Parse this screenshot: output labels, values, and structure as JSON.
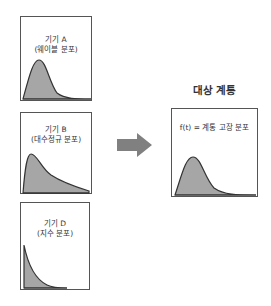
{
  "sources": [
    {
      "name": "기기 A",
      "distribution": "(웨이블 분포)",
      "curve": "weibull"
    },
    {
      "name": "기기 B",
      "distribution": "(대수정규 분포)",
      "curve": "lognormal"
    },
    {
      "name": "기기 D",
      "distribution": "(지수 분포)",
      "curve": "exponential"
    }
  ],
  "arrow": {
    "icon": "right-arrow-icon",
    "color": "#808080"
  },
  "target": {
    "title": "대상 계통",
    "label": "f(t) = 계통 고장 분포",
    "curve": "weibull"
  },
  "colors": {
    "fill": "#a6a6a6",
    "stroke": "#333333",
    "border": "#555555"
  }
}
